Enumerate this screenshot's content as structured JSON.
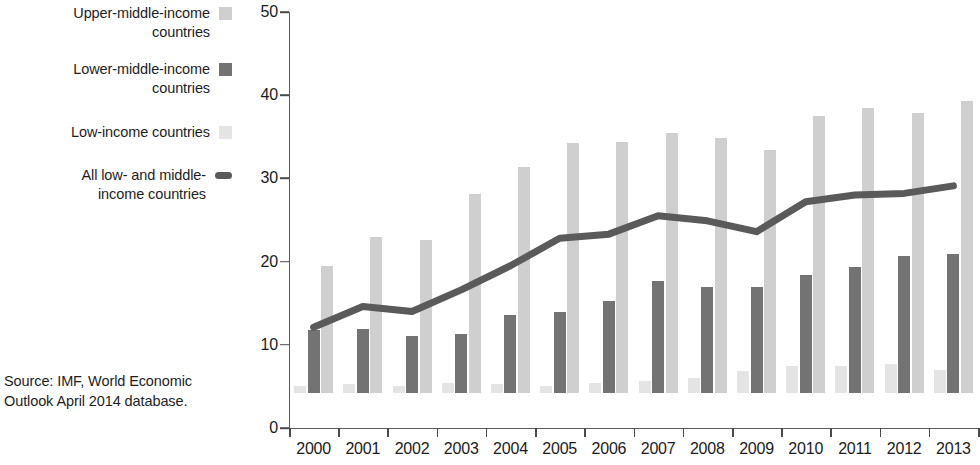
{
  "legend": {
    "items": [
      {
        "label": "Upper-middle-income\ncountries",
        "marker": "swatch",
        "color": "#cfcfcf",
        "name": "legend-upper-middle-income"
      },
      {
        "label": "Lower-middle-income\ncountries",
        "marker": "swatch",
        "color": "#737373",
        "name": "legend-lower-middle-income"
      },
      {
        "label": "Low-income countries",
        "marker": "swatch",
        "color": "#e4e4e4",
        "name": "legend-low-income"
      },
      {
        "label": "All low- and middle-\nincome countries",
        "marker": "line",
        "color": "#5a5a5a",
        "name": "legend-all-low-and-middle-income"
      }
    ]
  },
  "source": {
    "text": "Source:  IMF, World Economic\nOutlook April 2014 database."
  },
  "chart_data": {
    "type": "bar",
    "title": "",
    "subtitle": "",
    "xlabel": "",
    "ylabel": "",
    "categories": [
      "2000",
      "2001",
      "2002",
      "2003",
      "2004",
      "2005",
      "2006",
      "2007",
      "2008",
      "2009",
      "2010",
      "2011",
      "2012",
      "2013"
    ],
    "ylim": [
      0,
      50
    ],
    "yticks": [
      0,
      10,
      20,
      30,
      40,
      50
    ],
    "ytick_labels": [
      "0",
      "10",
      "20",
      "30",
      "40",
      "50"
    ],
    "grid": false,
    "legend_position": "left",
    "series": [
      {
        "name": "Low-income countries",
        "kind": "bar",
        "color": "#e4e4e4",
        "values": [
          0.9,
          1.1,
          0.9,
          1.2,
          1.1,
          0.9,
          1.2,
          1.5,
          1.8,
          2.6,
          3.3,
          3.3,
          3.5,
          2.8
        ]
      },
      {
        "name": "Lower-middle-income countries",
        "kind": "bar",
        "color": "#737373",
        "values": [
          7.6,
          7.7,
          6.8,
          7.1,
          9.4,
          9.7,
          11.0,
          13.5,
          12.8,
          12.8,
          14.2,
          15.2,
          16.5,
          16.7
        ]
      },
      {
        "name": "Upper-middle-income countries",
        "kind": "bar",
        "color": "#cfcfcf",
        "values": [
          15.3,
          18.8,
          18.4,
          23.9,
          27.2,
          30.0,
          30.2,
          31.3,
          30.6,
          29.2,
          33.3,
          34.3,
          33.6,
          35.1
        ]
      },
      {
        "name": "All low- and middle-income countries",
        "kind": "line",
        "color": "#5a5a5a",
        "values": [
          12.1,
          14.6,
          14.0,
          16.6,
          19.5,
          22.8,
          23.3,
          25.5,
          24.9,
          23.6,
          27.2,
          28.0,
          28.2,
          29.1
        ]
      }
    ]
  }
}
